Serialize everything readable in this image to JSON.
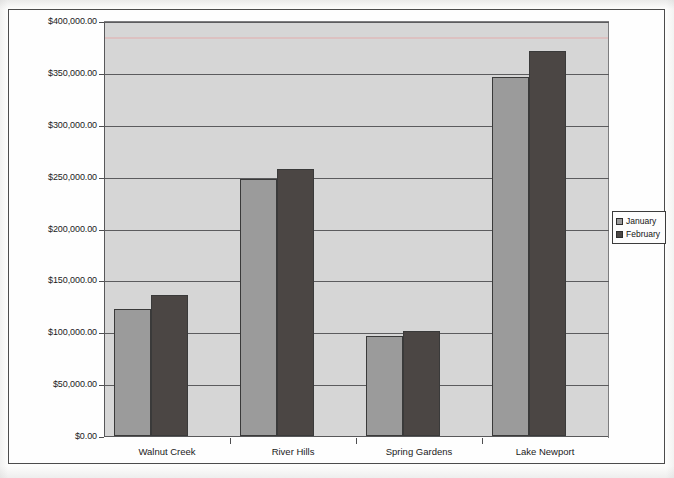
{
  "chart_data": {
    "type": "bar",
    "title": "",
    "xlabel": "",
    "ylabel": "",
    "categories": [
      "Walnut Creek",
      "River Hills",
      "Spring Gardens",
      "Lake Newport"
    ],
    "series": [
      {
        "name": "January",
        "color": "#9b9b9b",
        "values": [
          122000,
          248000,
          96000,
          346000
        ]
      },
      {
        "name": "February",
        "color": "#4b4644",
        "values": [
          136000,
          257000,
          101000,
          371000
        ]
      }
    ],
    "ylim": [
      0,
      400000
    ],
    "ytick_values": [
      0,
      50000,
      100000,
      150000,
      200000,
      250000,
      300000,
      350000,
      400000
    ],
    "ytick_labels": [
      "$0.00",
      "$50,000.00",
      "$100,000.00",
      "$150,000.00",
      "$200,000.00",
      "$250,000.00",
      "$300,000.00",
      "$350,000.00",
      "$400,000.00"
    ],
    "grid": true,
    "grid_axis": "y",
    "legend_position": "right",
    "plot_background": "#d6d6d6",
    "bar_border_color": "#3a3a3a"
  },
  "legend": {
    "entries": [
      {
        "label": "January"
      },
      {
        "label": "February"
      }
    ]
  }
}
